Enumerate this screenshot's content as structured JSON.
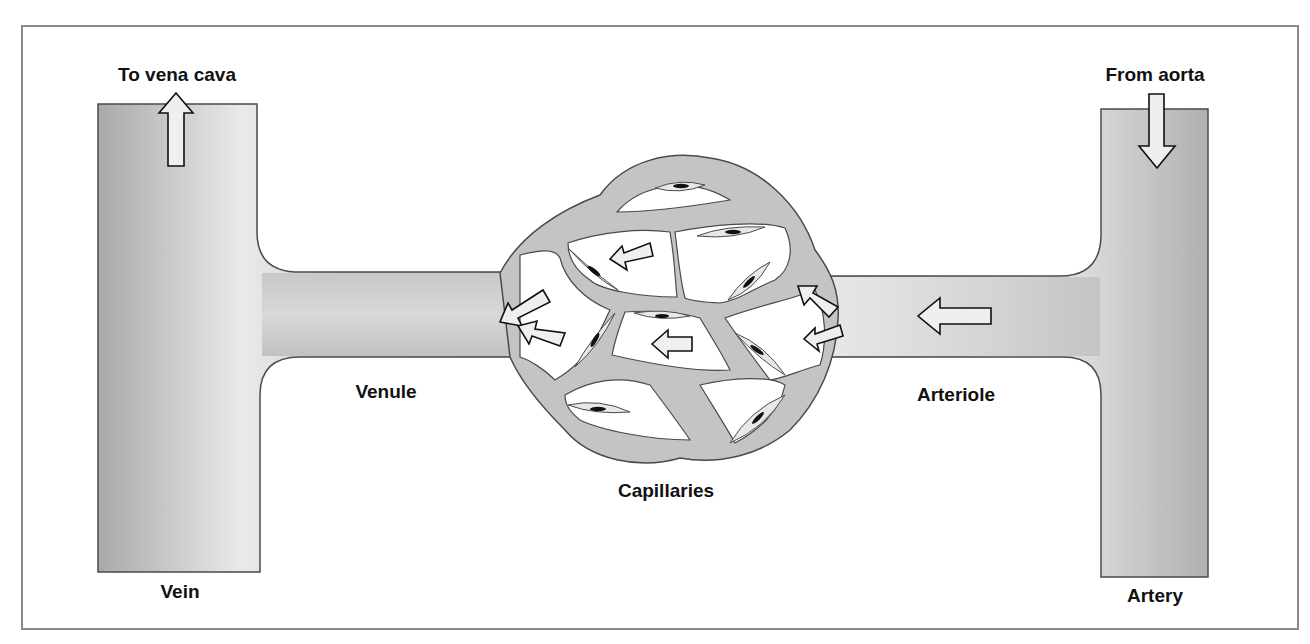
{
  "diagram": {
    "labels": {
      "to_vena_cava": "To vena cava",
      "from_aorta": "From aorta",
      "vein": "Vein",
      "venule": "Venule",
      "capillaries": "Capillaries",
      "arteriole": "Arteriole",
      "artery": "Artery"
    },
    "flow_direction": "right-to-left (artery → arteriole → capillaries → venule → vein)",
    "colors": {
      "vessel_fill": "#c4c4c4",
      "vessel_light": "#ececec",
      "vessel_outline": "#4a4a4a",
      "frame_border": "#8a8a8a",
      "arrow_fill": "#eeeeee",
      "nucleus": "#111111"
    }
  }
}
